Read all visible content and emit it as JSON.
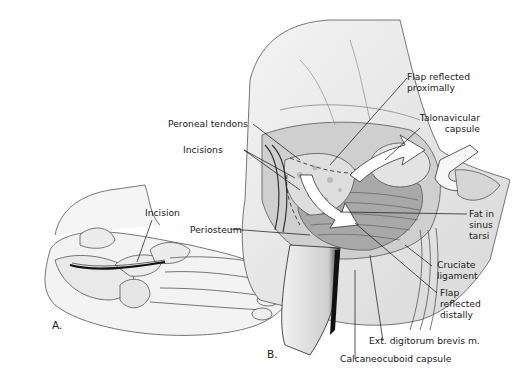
{
  "figure": {
    "panels": [
      {
        "id": "A",
        "label": "A.",
        "description": "Lateral view of foot showing incision"
      },
      {
        "id": "B",
        "label": "B.",
        "description": "Surgical exposure of lateral hindfoot"
      }
    ],
    "panel_a": {
      "labels": {
        "incision": "Incision"
      }
    },
    "panel_b": {
      "labels": {
        "flap_proximal_1": "Flap reflected",
        "flap_proximal_2": "proximally",
        "talonavicular_1": "Talonavicular",
        "talonavicular_2": "capsule",
        "peroneal_tendons": "Peroneal tendons",
        "incisions": "Incisions",
        "fat_1": "Fat in",
        "fat_2": "sinus",
        "fat_3": "tarsi",
        "periosteum": "Periosteum",
        "cruciate_1": "Cruciate",
        "cruciate_2": "ligament",
        "flap_distal_1": "Flap",
        "flap_distal_2": "reflected",
        "flap_distal_3": "distally",
        "edb": "Ext. digitorum brevis m.",
        "calcaneocuboid": "Calcaneocuboid capsule"
      }
    },
    "colors": {
      "background": "#ffffff",
      "ink": "#1a1a1a",
      "shade": "#bdbdbd",
      "light_shade": "#e6e6e6"
    }
  }
}
